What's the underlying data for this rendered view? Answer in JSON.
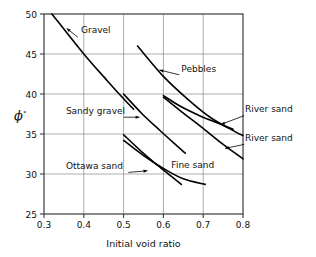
{
  "chart_data": {
    "type": "line",
    "title": "",
    "xlabel": "Initial void ratio",
    "ylabel": "ϕ°",
    "xlim": [
      0.3,
      0.8
    ],
    "ylim": [
      25,
      50
    ],
    "xticks": [
      "0.3",
      "0.4",
      "0.5",
      "0.6",
      "0.7",
      "0.8"
    ],
    "xtick_values": [
      0.3,
      0.4,
      0.5,
      0.6,
      0.7,
      0.8
    ],
    "yticks": [
      "25",
      "30",
      "35",
      "40",
      "45",
      "50"
    ],
    "ytick_values": [
      25,
      30,
      35,
      40,
      45,
      50
    ],
    "grid": true,
    "legend": "inline-annotations",
    "series": [
      {
        "name": "Gravel",
        "points": [
          [
            0.32,
            50.0
          ],
          [
            0.4,
            45.0
          ],
          [
            0.46,
            41.6
          ],
          [
            0.5,
            39.4
          ],
          [
            0.525,
            38.1
          ]
        ]
      },
      {
        "name": "Pebbles",
        "points": [
          [
            0.535,
            46.0
          ],
          [
            0.6,
            42.2
          ],
          [
            0.66,
            39.4
          ],
          [
            0.72,
            37.0
          ],
          [
            0.78,
            35.3
          ],
          [
            0.8,
            34.8
          ]
        ]
      },
      {
        "name": "Sandy gravel",
        "points": [
          [
            0.5,
            40.0
          ],
          [
            0.545,
            37.6
          ],
          [
            0.59,
            35.5
          ],
          [
            0.63,
            33.7
          ],
          [
            0.655,
            32.6
          ]
        ]
      },
      {
        "name": "River sand",
        "points": [
          [
            0.6,
            39.8
          ],
          [
            0.645,
            38.4
          ],
          [
            0.695,
            37.2
          ],
          [
            0.74,
            36.3
          ],
          [
            0.775,
            35.6
          ]
        ]
      },
      {
        "name": "River sand",
        "points": [
          [
            0.6,
            39.6
          ],
          [
            0.645,
            37.8
          ],
          [
            0.695,
            35.9
          ],
          [
            0.745,
            33.9
          ],
          [
            0.8,
            31.9
          ]
        ]
      },
      {
        "name": "Ottawa sand",
        "points": [
          [
            0.5,
            34.9
          ],
          [
            0.545,
            32.8
          ],
          [
            0.585,
            31.1
          ],
          [
            0.62,
            29.7
          ],
          [
            0.645,
            28.7
          ]
        ]
      },
      {
        "name": "Fine sand",
        "points": [
          [
            0.5,
            34.2
          ],
          [
            0.55,
            32.3
          ],
          [
            0.6,
            30.7
          ],
          [
            0.65,
            29.4
          ],
          [
            0.705,
            28.7
          ]
        ]
      }
    ],
    "annotations": [
      {
        "label": "Gravel",
        "text_x": 0.393,
        "text_y": 47.6,
        "anchor": "start",
        "leader": [
          [
            0.385,
            47.1
          ],
          [
            0.357,
            48.2
          ]
        ],
        "arrow": "left"
      },
      {
        "label": "Pebbles",
        "text_x": 0.645,
        "text_y": 42.8,
        "anchor": "start",
        "leader": [
          [
            0.64,
            42.4
          ],
          [
            0.59,
            43.0
          ]
        ],
        "arrow": "left"
      },
      {
        "label": "Sandy gravel",
        "text_x": 0.355,
        "text_y": 37.5,
        "anchor": "start",
        "leader": [
          [
            0.5,
            37.1
          ],
          [
            0.54,
            37.1
          ]
        ],
        "arrow": "right"
      },
      {
        "label": "River sand",
        "text_x": 0.805,
        "text_y": 37.7,
        "anchor": "start",
        "leader": [
          [
            0.803,
            37.3
          ],
          [
            0.745,
            36.2
          ]
        ],
        "arrow": "left"
      },
      {
        "label": "River sand",
        "text_x": 0.805,
        "text_y": 34.1,
        "anchor": "start",
        "leader": [
          [
            0.803,
            33.7
          ],
          [
            0.755,
            33.2
          ]
        ],
        "arrow": "left"
      },
      {
        "label": "Ottawa sand",
        "text_x": 0.355,
        "text_y": 30.6,
        "anchor": "start",
        "leader": [
          [
            0.512,
            30.2
          ],
          [
            0.56,
            30.4
          ]
        ],
        "arrow": "right"
      },
      {
        "label": "Fine sand",
        "text_x": 0.62,
        "text_y": 30.7,
        "anchor": "start",
        "leader": null,
        "arrow": "none"
      }
    ]
  }
}
